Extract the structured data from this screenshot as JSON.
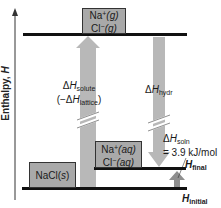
{
  "diagram": {
    "type": "enthalpy-diagram",
    "y_axis": {
      "label": "Enthalpy,",
      "symbol": "H"
    },
    "states": {
      "gas_ions": {
        "line1_prefix": "Na",
        "line1_sup": "+",
        "line1_phase": "(g)",
        "line2_prefix": "Cl",
        "line2_sup": "−",
        "line2_phase": "(g)"
      },
      "solid": {
        "text": "NaCl(",
        "phase": "s",
        "close": ")"
      },
      "aqueous_ions": {
        "line1_prefix": "Na",
        "line1_sup": "+",
        "line1_phase": "(aq)",
        "line2_prefix": "Cl",
        "line2_sup": "−",
        "line2_phase": "(aq)"
      }
    },
    "arrows": {
      "solute": {
        "delta": "Δ",
        "H": "H",
        "sub": "solute",
        "paren_open": "(−Δ",
        "paren_H": "H",
        "paren_sub": "lattice",
        "paren_close": ")",
        "direction": "up"
      },
      "hydration": {
        "delta": "Δ",
        "H": "H",
        "sub": "hydr",
        "direction": "down"
      },
      "solution": {
        "delta": "Δ",
        "H": "H",
        "sub": "soln",
        "value": "= 3.9 kJ/mol",
        "direction": "up"
      }
    },
    "levels": {
      "final": {
        "H": "H",
        "sub": "final"
      },
      "initial": {
        "H": "H",
        "sub": "initial"
      }
    },
    "colors": {
      "arrow": "#b8b8b8",
      "box": "#a9a9a9",
      "bar": "#111111",
      "small_arrow": "#8f8f8f"
    }
  }
}
